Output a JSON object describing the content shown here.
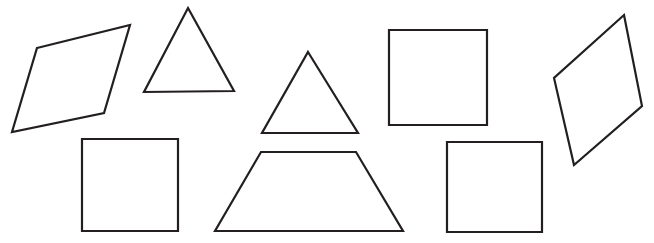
{
  "canvas": {
    "width": 654,
    "height": 243,
    "background_color": "#ffffff",
    "stroke_color": "#231f20",
    "fill_color": "#ffffff",
    "stroke_width": 2.2
  },
  "figure": {
    "type": "geometric-shapes-worksheet",
    "shape_count": 8,
    "rows": 2
  },
  "shapes": [
    {
      "id": "parallelogram-top-left",
      "name": "parallelogram",
      "row": 1,
      "position": "top-left",
      "sides": 4,
      "points": "37,48 130,25 104,113 12,132"
    },
    {
      "id": "triangle-top-left",
      "name": "triangle",
      "row": 1,
      "position": "top-second",
      "sides": 3,
      "points": "188,8 234,91 144,92"
    },
    {
      "id": "triangle-top-middle",
      "name": "triangle",
      "row": 1,
      "position": "top-third",
      "sides": 3,
      "points": "308,52 358,133 262,133"
    },
    {
      "id": "square-top-right",
      "name": "square",
      "row": 1,
      "position": "top-fourth",
      "sides": 4,
      "points": "389,30 487,30 487,125 389,125"
    },
    {
      "id": "parallelogram-top-right",
      "name": "parallelogram",
      "row": 1,
      "position": "top-right",
      "sides": 4,
      "points": "624,15 642,106 574,165 554,78"
    },
    {
      "id": "square-bottom-left",
      "name": "square",
      "row": 2,
      "position": "bottom-left",
      "sides": 4,
      "points": "82,139 178,139 178,231 82,231"
    },
    {
      "id": "trapezoid-bottom-middle",
      "name": "trapezoid",
      "row": 2,
      "position": "bottom-middle",
      "sides": 4,
      "points": "261,152 356,152 403,231 215,231"
    },
    {
      "id": "square-bottom-right",
      "name": "square",
      "row": 2,
      "position": "bottom-right",
      "sides": 4,
      "points": "447,142 542,142 542,232 447,232"
    }
  ]
}
